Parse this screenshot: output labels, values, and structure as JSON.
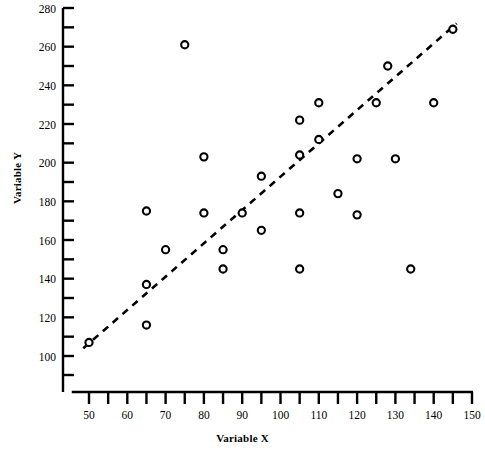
{
  "chart_data": {
    "type": "scatter",
    "title": "",
    "xlabel": "Variable X",
    "ylabel": "Variable Y",
    "xlim": [
      45.5,
      150
    ],
    "ylim": [
      95,
      280
    ],
    "grid": false,
    "legend": false,
    "x_ticks": [
      50,
      60,
      70,
      80,
      90,
      100,
      110,
      120,
      130,
      140,
      150
    ],
    "x_tick_labels": [
      "50",
      "60",
      "70",
      "80",
      "90",
      "100",
      "110",
      "120",
      "130",
      "140",
      "150"
    ],
    "x_minor_ticks": [
      55,
      65,
      75,
      85,
      95,
      105,
      115,
      125,
      135,
      145
    ],
    "y_ticks": [
      100,
      120,
      140,
      160,
      180,
      200,
      220,
      240,
      260,
      280
    ],
    "y_tick_labels": [
      "100",
      "120",
      "140",
      "160",
      "180",
      "200",
      "220",
      "240",
      "260",
      "280"
    ],
    "y_minor_ticks": [
      110,
      130,
      150,
      170,
      190,
      210,
      230,
      250,
      270
    ],
    "marker": "open-circle",
    "marker_color": "#000000",
    "points": [
      {
        "x": 50,
        "y": 107
      },
      {
        "x": 65,
        "y": 175
      },
      {
        "x": 65,
        "y": 137
      },
      {
        "x": 65,
        "y": 116
      },
      {
        "x": 70,
        "y": 155
      },
      {
        "x": 75,
        "y": 261
      },
      {
        "x": 80,
        "y": 203
      },
      {
        "x": 80,
        "y": 174
      },
      {
        "x": 85,
        "y": 155
      },
      {
        "x": 85,
        "y": 145
      },
      {
        "x": 90,
        "y": 174
      },
      {
        "x": 95,
        "y": 193
      },
      {
        "x": 95,
        "y": 165
      },
      {
        "x": 105,
        "y": 222
      },
      {
        "x": 105,
        "y": 204
      },
      {
        "x": 105,
        "y": 174
      },
      {
        "x": 105,
        "y": 145
      },
      {
        "x": 110,
        "y": 231
      },
      {
        "x": 110,
        "y": 212
      },
      {
        "x": 115,
        "y": 184
      },
      {
        "x": 120,
        "y": 202
      },
      {
        "x": 120,
        "y": 173
      },
      {
        "x": 125,
        "y": 231
      },
      {
        "x": 128,
        "y": 250
      },
      {
        "x": 130,
        "y": 202
      },
      {
        "x": 134,
        "y": 145
      },
      {
        "x": 140,
        "y": 231
      },
      {
        "x": 145,
        "y": 269
      }
    ],
    "trendline": {
      "style": "dashed",
      "color": "#000000",
      "x_start": 48.5,
      "y_start": 104,
      "x_end": 146,
      "y_end": 272
    }
  }
}
